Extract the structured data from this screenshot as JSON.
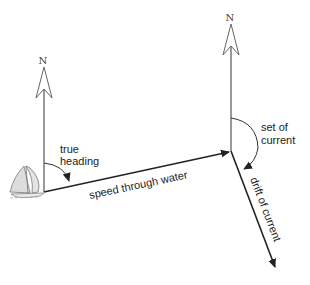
{
  "diagram": {
    "type": "vector-diagram",
    "topic": "current triangle / set and drift",
    "labels": {
      "north_left": "N",
      "north_right": "N",
      "true_heading_line1": "true",
      "true_heading_line2": "heading",
      "speed_through_water": "speed through water",
      "set_of_current_line1": "set of",
      "set_of_current_line2": "current",
      "drift_of_current": "drift of current"
    },
    "colors": {
      "line": "#222222",
      "north_arrow": "#555555",
      "boat_fill": "#dddddd",
      "boat_stroke": "#777777"
    }
  }
}
